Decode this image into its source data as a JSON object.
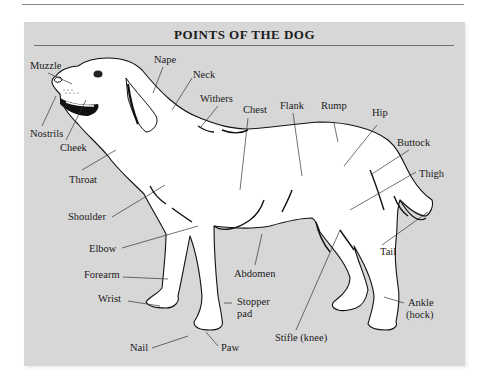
{
  "title": "POINTS OF THE DOG",
  "colors": {
    "panel": "#d7d7d7",
    "outline": "#111111",
    "leader": "#333333",
    "body": "#ffffff"
  },
  "labels": {
    "muzzle": "Muzzle",
    "nostrils": "Nostrils",
    "cheek": "Cheek",
    "throat": "Throat",
    "nape": "Nape",
    "neck": "Neck",
    "withers": "Withers",
    "chest": "Chest",
    "flank": "Flank",
    "rump": "Rump",
    "hip": "Hip",
    "buttock": "Buttock",
    "thigh": "Thigh",
    "tail": "Tail",
    "shoulder": "Shoulder",
    "elbow": "Elbow",
    "forearm": "Forearm",
    "wrist": "Wrist",
    "nail": "Nail",
    "paw": "Paw",
    "stopper_pad_1": "Stopper",
    "stopper_pad_2": "pad",
    "abdomen": "Abdomen",
    "stifle": "Stifle (knee)",
    "ankle_1": "Ankle",
    "ankle_2": "(hock)"
  }
}
